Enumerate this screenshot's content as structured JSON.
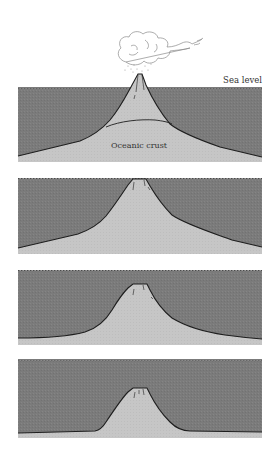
{
  "diagram": {
    "labels": {
      "sea_level": "Sea level",
      "oceanic_crust": "Oceanic crust"
    },
    "colors": {
      "water": "#7b7b7b",
      "crust": "#c6c6c6",
      "outline": "#1e1e1e",
      "background": "#ffffff",
      "cloud_outline": "#8a8a8a"
    },
    "panels": [
      {
        "stage": 1,
        "state": "active volcano erupting above sea level"
      },
      {
        "stage": 2,
        "state": "eroded flat-topped island at sea level"
      },
      {
        "stage": 3,
        "state": "subsided flat-topped seamount below sea level"
      },
      {
        "stage": 4,
        "state": "deeply submerged guyot"
      }
    ]
  }
}
